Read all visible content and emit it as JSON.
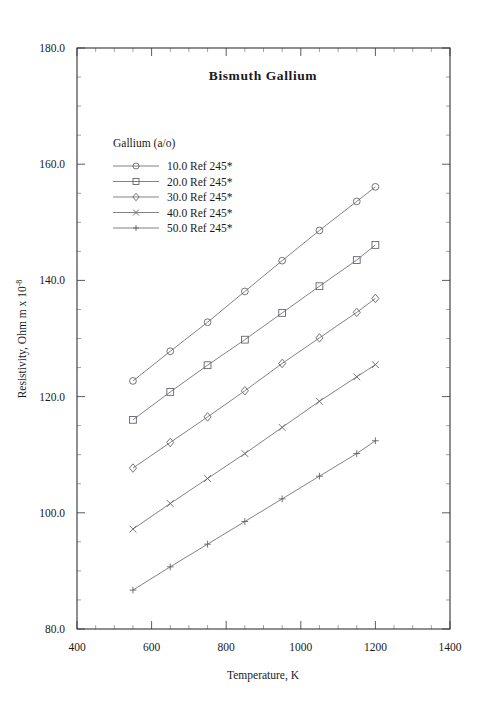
{
  "chart_data": {
    "type": "line",
    "title": "Bismuth  Gallium",
    "xlabel": "Temperature,  K",
    "ylabel": "Resistivity, Ohm m x 10",
    "ylabel_exponent": "-8",
    "xlim": [
      400,
      1400
    ],
    "ylim": [
      80.0,
      180.0
    ],
    "xticks": [
      400,
      600,
      800,
      1000,
      1200,
      1400
    ],
    "xtick_labels": [
      "400",
      "600",
      "800",
      "1000",
      "1200",
      "1400"
    ],
    "yticks": [
      80.0,
      100.0,
      120.0,
      140.0,
      160.0,
      180.0
    ],
    "ytick_labels": [
      "80.0",
      "100.0",
      "120.0",
      "140.0",
      "160.0",
      "180.0"
    ],
    "x_minor_step": 50,
    "y_minor_step": 5,
    "grid": false,
    "legend_position": "upper-left-inside",
    "legend_title": "Gallium (a/o)",
    "x": [
      550,
      650,
      750,
      850,
      950,
      1050,
      1150,
      1200
    ],
    "series": [
      {
        "name": "10.0 Ref 245*",
        "marker": "circle",
        "values": [
          122.7,
          127.8,
          132.8,
          138.1,
          143.4,
          148.6,
          153.6,
          156.1
        ]
      },
      {
        "name": "20.0 Ref 245*",
        "marker": "square",
        "values": [
          116.0,
          120.8,
          125.4,
          129.8,
          134.4,
          139.0,
          143.5,
          146.1
        ]
      },
      {
        "name": "30.0 Ref 245*",
        "marker": "diamond",
        "values": [
          107.7,
          112.1,
          116.5,
          121.0,
          125.7,
          130.1,
          134.5,
          136.9
        ]
      },
      {
        "name": "40.0 Ref 245*",
        "marker": "cross",
        "values": [
          97.2,
          101.6,
          105.9,
          110.2,
          114.7,
          119.2,
          123.4,
          125.5
        ]
      },
      {
        "name": "50.0 Ref 245*",
        "marker": "plus",
        "values": [
          86.7,
          90.7,
          94.6,
          98.5,
          102.4,
          106.3,
          110.2,
          112.4
        ]
      }
    ]
  },
  "colors": {
    "frame": "#33333a",
    "line": "#6b6b73",
    "marker": "#5c5c64",
    "text": "#1a1a1a",
    "background": "#ffffff"
  }
}
